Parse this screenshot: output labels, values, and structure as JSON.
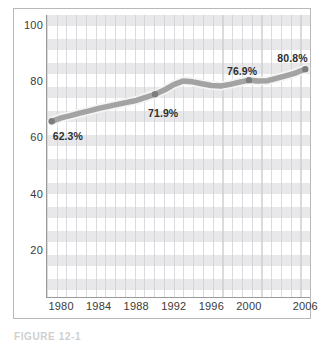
{
  "figure": {
    "caption": "FIGURE 12-1"
  },
  "chart_data": {
    "type": "line",
    "title": "",
    "xlabel": "",
    "ylabel": "",
    "xlim": [
      1978.5,
      2006.5
    ],
    "ylim": [
      0,
      100
    ],
    "grid": true,
    "legend": "none",
    "y_ticks": [
      "100",
      "80",
      "60",
      "40",
      "20"
    ],
    "y_tick_values": [
      100,
      80,
      60,
      40,
      20
    ],
    "x_ticks": [
      "1980",
      "1984",
      "1988",
      "1992",
      "1996",
      "2000",
      "2006"
    ],
    "x_tick_values": [
      1980,
      1984,
      1988,
      1992,
      1996,
      2000,
      2006
    ],
    "series": [
      {
        "name": "Percent",
        "x": [
          1979,
          1980,
          1981,
          1982,
          1983,
          1984,
          1985,
          1986,
          1987,
          1988,
          1989,
          1990,
          1991,
          1992,
          1993,
          1994,
          1995,
          1996,
          1997,
          1998,
          1999,
          2000,
          2001,
          2002,
          2003,
          2004,
          2005,
          2006
        ],
        "values": [
          62.3,
          63.5,
          64.3,
          65.2,
          66.0,
          66.9,
          67.6,
          68.3,
          69.0,
          69.7,
          70.8,
          71.9,
          73.4,
          75.3,
          76.6,
          76.3,
          75.6,
          75.0,
          74.8,
          75.4,
          76.2,
          76.9,
          76.6,
          76.7,
          77.6,
          78.5,
          79.5,
          80.8
        ]
      }
    ],
    "annotations": [
      {
        "label": "62.3%",
        "x": 1979,
        "y": 62.3
      },
      {
        "label": "71.9%",
        "x": 1990,
        "y": 71.9
      },
      {
        "label": "76.9%",
        "x": 2000,
        "y": 76.9
      },
      {
        "label": "80.8%",
        "x": 2006,
        "y": 80.8
      }
    ],
    "colors": {
      "line": "#a3a3a3",
      "line_shadow": "#f2f2f2",
      "marker": "#7d7d7d",
      "band": "#e4e4e6",
      "gridline": "#cdcfd4",
      "axis": "#9a9a9a",
      "text": "#3a3a3a",
      "frame": "#b9b9b9"
    }
  }
}
